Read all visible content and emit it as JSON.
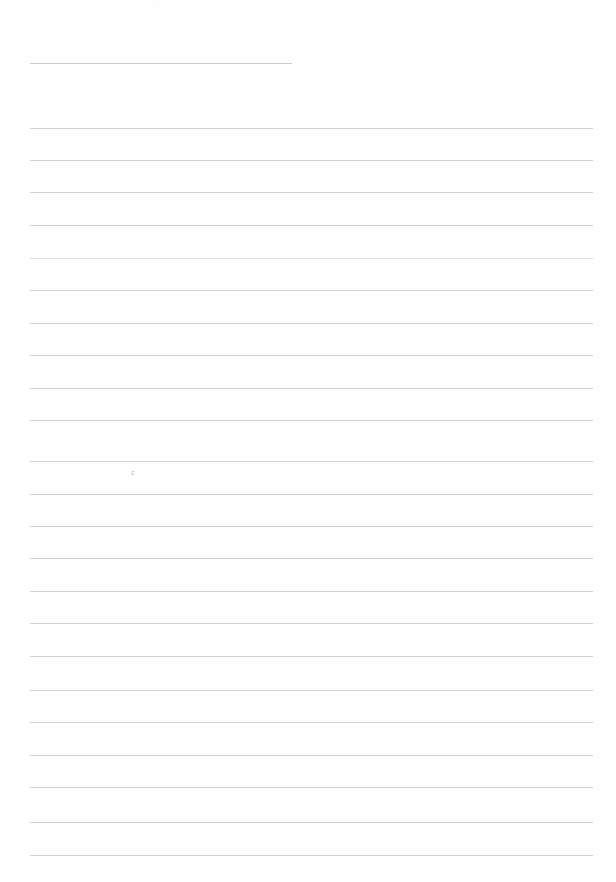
{
  "page": {
    "label": "blank ruled page",
    "width_px": 616,
    "height_px": 882,
    "background_color": "#fefefe",
    "rule_color": "#cfcfcf",
    "faded_rule_color": "#dcdcdc",
    "glyph_color": "#b9b9b9"
  },
  "title_rule": {
    "label": "title underline",
    "x": 30,
    "y": 63,
    "width": 262
  },
  "rules": [
    {
      "y": 128,
      "x": 30,
      "width": 563,
      "faded": false
    },
    {
      "y": 160,
      "x": 30,
      "width": 563,
      "faded": false
    },
    {
      "y": 192,
      "x": 30,
      "width": 563,
      "faded": false
    },
    {
      "y": 225,
      "x": 30,
      "width": 563,
      "faded": false
    },
    {
      "y": 258,
      "x": 30,
      "width": 563,
      "faded": true
    },
    {
      "y": 290,
      "x": 30,
      "width": 563,
      "faded": false
    },
    {
      "y": 323,
      "x": 30,
      "width": 563,
      "faded": false
    },
    {
      "y": 355,
      "x": 30,
      "width": 563,
      "faded": false
    },
    {
      "y": 388,
      "x": 30,
      "width": 563,
      "faded": false
    },
    {
      "y": 420,
      "x": 30,
      "width": 563,
      "faded": false
    },
    {
      "y": 461,
      "x": 30,
      "width": 563,
      "faded": false
    },
    {
      "y": 494,
      "x": 30,
      "width": 563,
      "faded": false
    },
    {
      "y": 526,
      "x": 30,
      "width": 563,
      "faded": false
    },
    {
      "y": 558,
      "x": 30,
      "width": 563,
      "faded": false
    },
    {
      "y": 591,
      "x": 30,
      "width": 563,
      "faded": false
    },
    {
      "y": 623,
      "x": 30,
      "width": 563,
      "faded": false
    },
    {
      "y": 656,
      "x": 30,
      "width": 563,
      "faded": false
    },
    {
      "y": 690,
      "x": 30,
      "width": 563,
      "faded": false
    },
    {
      "y": 722,
      "x": 30,
      "width": 563,
      "faded": false
    },
    {
      "y": 755,
      "x": 30,
      "width": 563,
      "faded": false
    },
    {
      "y": 787,
      "x": 30,
      "width": 563,
      "faded": false
    },
    {
      "y": 822,
      "x": 30,
      "width": 563,
      "faded": false
    },
    {
      "y": 855,
      "x": 30,
      "width": 563,
      "faded": false
    }
  ],
  "marks": [
    {
      "name": "stray-character",
      "text": "c",
      "x": 131,
      "y": 469,
      "style": "stray-c"
    },
    {
      "name": "top-speck",
      "text": "·",
      "x": 154,
      "y": 3,
      "style": "top-speck"
    }
  ]
}
